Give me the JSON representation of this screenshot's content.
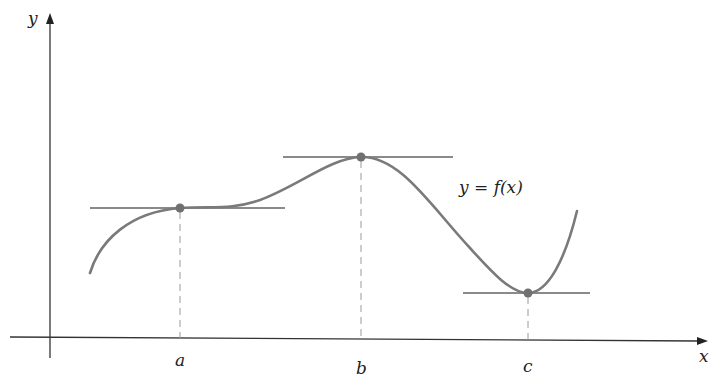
{
  "diagram": {
    "type": "function-graph-with-horizontal-tangents",
    "axes": {
      "x_label": "x",
      "y_label": "y"
    },
    "curve_label": "y = f(x)",
    "points": [
      {
        "label": "a",
        "kind": "horizontal tangent (inflection)"
      },
      {
        "label": "b",
        "kind": "local maximum"
      },
      {
        "label": "c",
        "kind": "local minimum"
      }
    ],
    "colors": {
      "axis": "#333333",
      "curve": "#7a7a7a",
      "tangent": "#8a8a8a",
      "point": "#707070",
      "dashed": "#9a9a9a"
    }
  }
}
